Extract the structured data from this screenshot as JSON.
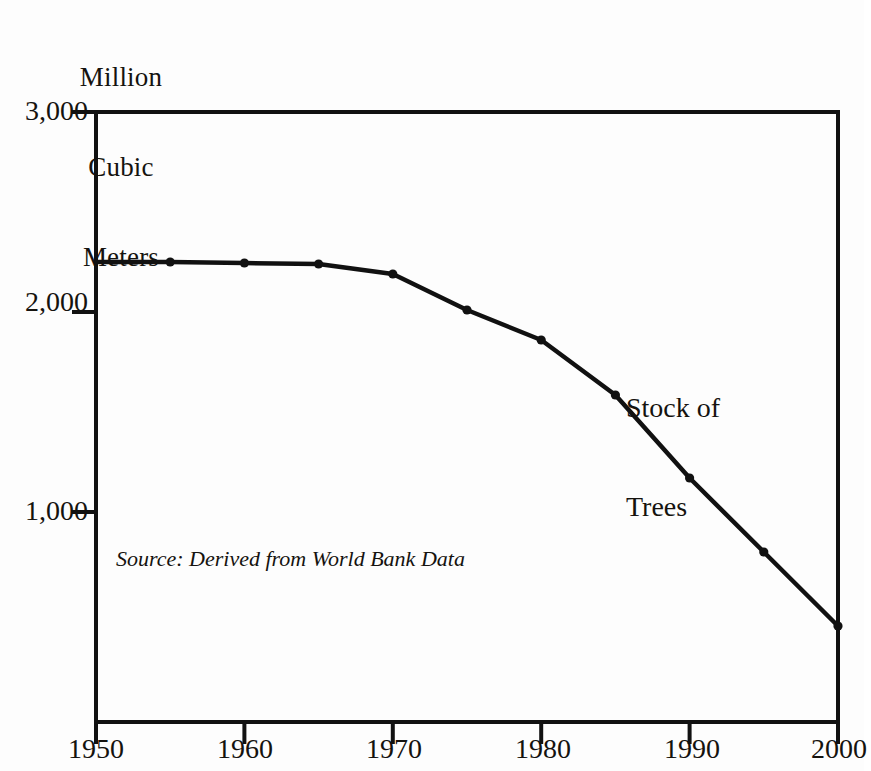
{
  "axis_unit_caption": {
    "line1": "Million",
    "line2": "Cubic",
    "line3": "Meters"
  },
  "annotations": {
    "series_label_line1": "Stock of",
    "series_label_line2": "Trees",
    "source_note": "Source: Derived from World Bank Data"
  },
  "colors": {
    "ink": "#15130f",
    "line": "#111111",
    "background": "#fdfdfd"
  },
  "y_ticks": [
    {
      "label": "3,000",
      "value": 3000
    },
    {
      "label": "2,000",
      "value": 2000
    },
    {
      "label": "1,000",
      "value": 1000
    }
  ],
  "x_ticks": [
    {
      "label": "1950",
      "value": 1950
    },
    {
      "label": "1960",
      "value": 1960
    },
    {
      "label": "1970",
      "value": 1970
    },
    {
      "label": "1980",
      "value": 1980
    },
    {
      "label": "1990",
      "value": 1990
    },
    {
      "label": "2000",
      "value": 2000
    }
  ],
  "chart_data": {
    "type": "line",
    "title": "",
    "subtitle": "",
    "xlabel": "",
    "ylabel": "Million Cubic Meters",
    "xlim": [
      1950,
      2000
    ],
    "ylim": [
      0,
      3000
    ],
    "grid": false,
    "legend": "inline-annotation",
    "legend_position": "inside-right",
    "annotation": "Stock of Trees",
    "source": "Source: Derived from World Bank Data",
    "x_tick_labels": [
      "1950",
      "1960",
      "1970",
      "1980",
      "1990",
      "2000"
    ],
    "y_tick_labels": [
      "1,000",
      "2,000",
      "3,000"
    ],
    "markers": "filled-circle",
    "series": [
      {
        "name": "Stock of Trees",
        "x": [
          1950,
          1955,
          1960,
          1965,
          1970,
          1975,
          1980,
          1985,
          1990,
          1995,
          2000
        ],
        "values": [
          2250,
          2250,
          2245,
          2240,
          2190,
          2010,
          1860,
          1585,
          1170,
          800,
          430
        ]
      }
    ]
  }
}
